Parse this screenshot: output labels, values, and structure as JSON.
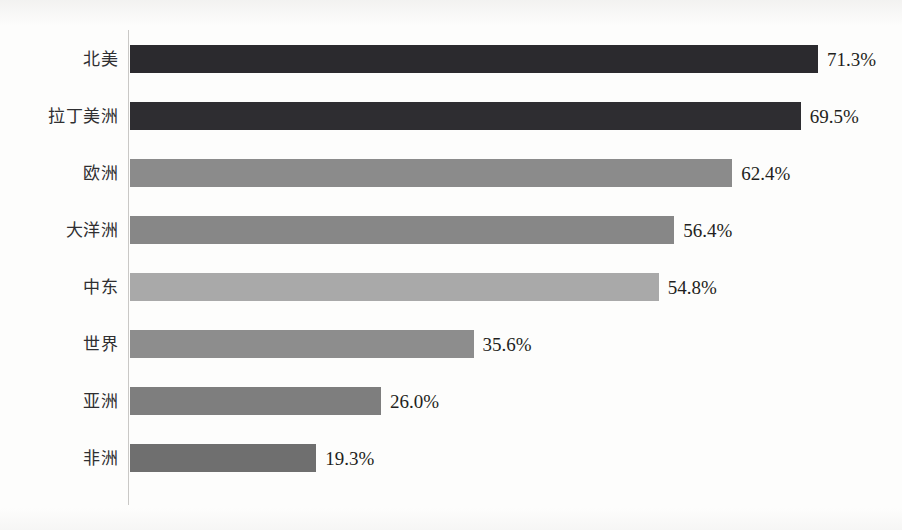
{
  "chart_data": {
    "type": "bar",
    "orientation": "horizontal",
    "title": "",
    "subtitle": "",
    "xlabel": "",
    "ylabel": "",
    "xlim": [
      0,
      80
    ],
    "grid": false,
    "legend": null,
    "value_suffix": "%",
    "categories": [
      "北美",
      "拉丁美洲",
      "欧洲",
      "大洋洲",
      "中东",
      "世界",
      "亚洲",
      "非洲"
    ],
    "values": [
      71.3,
      69.5,
      62.4,
      56.4,
      54.8,
      35.6,
      26.0,
      19.3
    ],
    "value_labels": [
      "71.3%",
      "69.5%",
      "62.4%",
      "56.4%",
      "54.8%",
      "35.6%",
      "26.0%",
      "19.3%"
    ],
    "bar_colors": [
      "#2b2a2e",
      "#2e2d31",
      "#8b8b8b",
      "#878787",
      "#a9a9a9",
      "#8d8d8d",
      "#7e7e7e",
      "#6f6f6f"
    ],
    "bars": [
      {
        "category": "北美",
        "value": 71.3,
        "label": "71.3%",
        "color": "#2b2a2e"
      },
      {
        "category": "拉丁美洲",
        "value": 69.5,
        "label": "69.5%",
        "color": "#2e2d31"
      },
      {
        "category": "欧洲",
        "value": 62.4,
        "label": "62.4%",
        "color": "#8b8b8b"
      },
      {
        "category": "大洋洲",
        "value": 56.4,
        "label": "56.4%",
        "color": "#878787"
      },
      {
        "category": "中东",
        "value": 54.8,
        "label": "54.8%",
        "color": "#a9a9a9"
      },
      {
        "category": "世界",
        "value": 35.6,
        "label": "35.6%",
        "color": "#8d8d8d"
      },
      {
        "category": "亚洲",
        "value": 26.0,
        "label": "26.0%",
        "color": "#7e7e7e"
      },
      {
        "category": "非洲",
        "value": 19.3,
        "label": "19.3%",
        "color": "#6f6f6f"
      }
    ]
  },
  "layout": {
    "axis_color": "#c9c8c6",
    "background": "#fdfdfc",
    "plot_left_px": 130,
    "px_per_unit": 9.65,
    "row_pitch_px": 57,
    "first_row_top_px": 44,
    "bar_height_px": 28,
    "label_gap_px": 9
  }
}
